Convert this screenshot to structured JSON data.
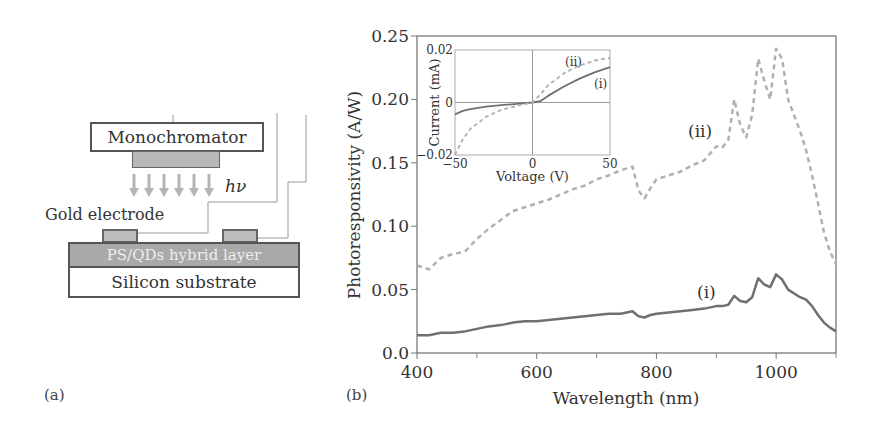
{
  "panel_a": {
    "label": "(a)",
    "monochromator": "Monochromator",
    "photon_label": "hν",
    "electrode_label": "Gold electrode",
    "hybrid_layer": "PS/QDs hybrid layer",
    "substrate": "Silicon substrate"
  },
  "panel_b": {
    "label": "(b)",
    "main_curve_labels": {
      "i": "(i)",
      "ii": "(ii)"
    },
    "inset_curve_labels": {
      "i": "(i)",
      "ii": "(ii)"
    }
  },
  "chart_data": [
    {
      "type": "line",
      "title": "",
      "xlabel": "Wavelength (nm)",
      "ylabel": "Photoresponsivity (A/W)",
      "xlim": [
        400,
        1100
      ],
      "ylim": [
        0.0,
        0.25
      ],
      "xticks": [
        400,
        600,
        800,
        1000
      ],
      "xtick_minor": [
        500,
        700,
        900,
        1100
      ],
      "yticks": [
        "0.0",
        "0.05",
        "0.10",
        "0.15",
        "0.20",
        "0.25"
      ],
      "grid": false,
      "series": [
        {
          "name": "(i)",
          "style": "solid",
          "color": "#707070",
          "x": [
            400,
            420,
            440,
            460,
            480,
            500,
            520,
            540,
            560,
            580,
            600,
            620,
            640,
            660,
            680,
            700,
            720,
            740,
            760,
            770,
            780,
            790,
            800,
            820,
            840,
            860,
            880,
            900,
            910,
            920,
            930,
            940,
            950,
            960,
            970,
            980,
            990,
            1000,
            1010,
            1020,
            1040,
            1050,
            1060,
            1070,
            1080,
            1090,
            1100
          ],
          "y": [
            0.014,
            0.014,
            0.016,
            0.016,
            0.017,
            0.019,
            0.021,
            0.022,
            0.024,
            0.025,
            0.025,
            0.026,
            0.027,
            0.028,
            0.029,
            0.03,
            0.031,
            0.031,
            0.033,
            0.029,
            0.028,
            0.03,
            0.031,
            0.032,
            0.033,
            0.034,
            0.035,
            0.037,
            0.037,
            0.038,
            0.045,
            0.041,
            0.04,
            0.044,
            0.059,
            0.054,
            0.052,
            0.062,
            0.058,
            0.05,
            0.044,
            0.042,
            0.037,
            0.03,
            0.024,
            0.02,
            0.017
          ]
        },
        {
          "name": "(ii)",
          "style": "dashed",
          "color": "#b0b0b0",
          "x": [
            400,
            420,
            440,
            460,
            480,
            500,
            520,
            540,
            560,
            580,
            600,
            620,
            640,
            660,
            680,
            700,
            720,
            740,
            760,
            770,
            780,
            790,
            800,
            820,
            840,
            860,
            880,
            900,
            910,
            920,
            930,
            940,
            950,
            960,
            970,
            980,
            990,
            1000,
            1010,
            1020,
            1040,
            1050,
            1060,
            1070,
            1080,
            1090,
            1100
          ],
          "y": [
            0.069,
            0.066,
            0.075,
            0.078,
            0.08,
            0.09,
            0.098,
            0.105,
            0.112,
            0.115,
            0.118,
            0.121,
            0.125,
            0.129,
            0.132,
            0.137,
            0.14,
            0.144,
            0.147,
            0.128,
            0.122,
            0.13,
            0.137,
            0.14,
            0.143,
            0.148,
            0.152,
            0.163,
            0.162,
            0.168,
            0.2,
            0.18,
            0.17,
            0.188,
            0.232,
            0.215,
            0.2,
            0.24,
            0.232,
            0.2,
            0.175,
            0.16,
            0.14,
            0.118,
            0.095,
            0.08,
            0.07
          ]
        }
      ]
    },
    {
      "type": "line",
      "title": "inset",
      "xlabel": "Voltage (V)",
      "ylabel": "Current (mA)",
      "xlim": [
        -50,
        50
      ],
      "ylim": [
        -0.02,
        0.02
      ],
      "xticks": [
        "-50",
        "0",
        "50"
      ],
      "yticks": [
        "-0.02",
        "0",
        "0.02"
      ],
      "grid": false,
      "series": [
        {
          "name": "(i)",
          "style": "solid",
          "color": "#707070",
          "x": [
            -50,
            -45,
            -40,
            -30,
            -20,
            -10,
            0,
            5,
            10,
            20,
            30,
            40,
            50
          ],
          "y": [
            -0.0045,
            -0.0032,
            -0.0025,
            -0.0016,
            -0.001,
            -0.0005,
            0.0,
            0.0005,
            0.0025,
            0.006,
            0.009,
            0.0115,
            0.0135
          ]
        },
        {
          "name": "(ii)",
          "style": "dashed",
          "color": "#b0b0b0",
          "x": [
            -50,
            -45,
            -40,
            -30,
            -20,
            -10,
            0,
            5,
            10,
            20,
            30,
            40,
            50
          ],
          "y": [
            -0.02,
            -0.014,
            -0.01,
            -0.0055,
            -0.0028,
            -0.0012,
            0.0,
            0.003,
            0.0065,
            0.011,
            0.014,
            0.016,
            0.017
          ]
        }
      ]
    }
  ]
}
